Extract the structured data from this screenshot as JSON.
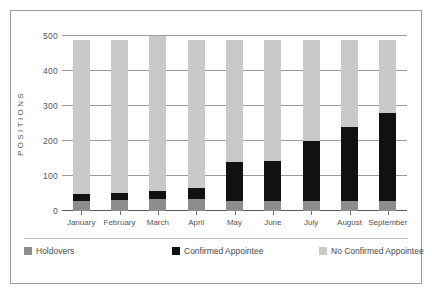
{
  "chart_data": {
    "type": "bar",
    "stacked": true,
    "title": "",
    "subtitle": "",
    "xlabel": "",
    "ylabel": "POSITIONS",
    "ylim": [
      0,
      500
    ],
    "yticks": [
      0,
      100,
      200,
      300,
      400,
      500
    ],
    "ytick_labels": [
      "0",
      "100",
      "200",
      "300",
      "400",
      "500"
    ],
    "grid": true,
    "legend_position": "bottom",
    "categories": [
      "January",
      "February",
      "March",
      "April",
      "May",
      "June",
      "July",
      "August",
      "September"
    ],
    "series": [
      {
        "name": "Holdovers",
        "color": "#8d8d8d",
        "values": [
          30,
          32,
          33,
          35,
          30,
          30,
          30,
          30,
          30
        ]
      },
      {
        "name": "Confirmed Appointee",
        "color": "#111111",
        "values": [
          18,
          20,
          23,
          30,
          110,
          112,
          170,
          210,
          250
        ]
      },
      {
        "name": "No Confirmed Appointee",
        "color": "#c9c9c9",
        "values": [
          442,
          438,
          444,
          425,
          350,
          348,
          290,
          250,
          210
        ]
      }
    ],
    "cumulative_tops": {
      "holdovers": [
        30,
        32,
        33,
        35,
        30,
        30,
        30,
        30,
        30
      ],
      "confirmed": [
        48,
        52,
        56,
        65,
        140,
        142,
        200,
        240,
        280
      ],
      "total": [
        490,
        490,
        490,
        490,
        490,
        490,
        490,
        490,
        490
      ]
    }
  },
  "legend": {
    "items": [
      {
        "label": "Holdovers",
        "color": "#8d8d8d"
      },
      {
        "label": "Confirmed Appointee",
        "color": "#111111"
      },
      {
        "label": "No Confirmed Appointee",
        "color": "#c9c9c9"
      }
    ]
  }
}
